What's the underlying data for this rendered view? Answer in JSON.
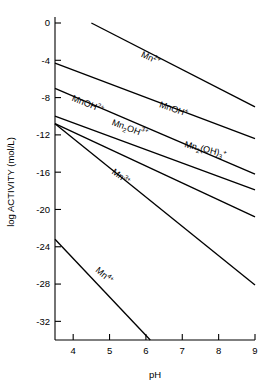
{
  "chart_data": {
    "type": "line",
    "title": "",
    "xlabel": "pH",
    "ylabel": "log ACTIVITY (mol/L)",
    "xlim": [
      3.5,
      9
    ],
    "ylim": [
      -34,
      0
    ],
    "xticks": [
      4,
      5,
      6,
      7,
      8,
      9
    ],
    "xticklabels": [
      "4",
      "5",
      "6",
      "7",
      "8",
      "9"
    ],
    "yticks": [
      0,
      -4,
      -8,
      -12,
      -16,
      -20,
      -24,
      -28,
      -32
    ],
    "yticklabels": [
      "0",
      "-4",
      "-8",
      "-12",
      "-16",
      "-20",
      "-24",
      "-28",
      "-32"
    ],
    "grid": false,
    "legend": "inline-labels",
    "convergence_point": {
      "ph": 6.7,
      "log_activity": -13.8
    },
    "series": [
      {
        "name": "Mn2+",
        "label_parts": {
          "base": "Mn",
          "sup": "2+",
          "sub": ""
        },
        "x": [
          4.5,
          9.0
        ],
        "y": [
          0.0,
          -9.0
        ],
        "slope": -2.0,
        "label_x": 5.85,
        "label_y": -3.6,
        "label_rot": 25
      },
      {
        "name": "MnOH+",
        "label_parts": {
          "base": "MnOH",
          "sup": "+",
          "sub": ""
        },
        "x": [
          3.5,
          9.0
        ],
        "y": [
          -4.3,
          -12.4
        ],
        "slope": -1.47,
        "label_x": 6.35,
        "label_y": -9.0,
        "label_rot": 19
      },
      {
        "name": "MnOH2+",
        "label_parts": {
          "base": "MnOH",
          "sup": "2+",
          "sub": ""
        },
        "x": [
          3.5,
          9.0
        ],
        "y": [
          -7.0,
          -16.2
        ],
        "slope": -1.67,
        "label_x": 3.95,
        "label_y": -8.3,
        "label_rot": 22
      },
      {
        "name": "Mn2OH3+",
        "label_parts": {
          "base": "Mn",
          "sub": "2",
          "mid": "OH",
          "sup": "3+"
        },
        "x": [
          3.5,
          9.0
        ],
        "y": [
          -10.0,
          -17.9
        ],
        "slope": -1.44,
        "label_x": 5.05,
        "label_y": -10.9,
        "label_rot": 21
      },
      {
        "name": "Mn2(OH)3+",
        "label_parts": {
          "base": "Mn",
          "sub": "2",
          "mid": "(OH)",
          "sub2": "3",
          "sup": "+"
        },
        "x": [
          3.5,
          9.0
        ],
        "y": [
          -10.8,
          -20.8
        ],
        "slope": -1.82,
        "label_x": 7.05,
        "label_y": -13.3,
        "label_rot": 14
      },
      {
        "name": "Mn3+",
        "label_parts": {
          "base": "Mn",
          "sup": "3+",
          "sub": ""
        },
        "x": [
          3.5,
          9.0
        ],
        "y": [
          -10.8,
          -28.1
        ],
        "slope": -3.15,
        "label_x": 5.05,
        "label_y": -16.1,
        "label_rot": 37
      },
      {
        "name": "Mn4+",
        "label_parts": {
          "base": "Mn",
          "sup": "4+",
          "sub": ""
        },
        "x": [
          3.5,
          6.12
        ],
        "y": [
          -23.2,
          -34.0
        ],
        "slope": -4.12,
        "label_x": 4.6,
        "label_y": -26.6,
        "label_rot": 41
      }
    ]
  },
  "axes": {
    "x_title": "pH",
    "y_title": "log ACTIVITY (mol/L)"
  }
}
